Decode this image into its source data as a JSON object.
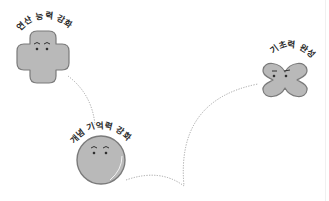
{
  "diagram": {
    "type": "learning-path",
    "colors": {
      "background": "#ffffff",
      "shape_fill": "#b9b9b9",
      "shape_stroke": "#7a7a7a",
      "shape_highlight": "#ffffff",
      "path_stroke": "#9a9a9a",
      "label_text": "#2a2a2a"
    },
    "nodes": [
      {
        "id": "calc",
        "label": "연산 능력 강화",
        "shape": "plus",
        "face": "smiling"
      },
      {
        "id": "concept",
        "label": "개념 기억력 강화",
        "shape": "circle",
        "face": "smiling"
      },
      {
        "id": "basics",
        "label": "기초력 완성",
        "shape": "x-clover",
        "face": "determined"
      }
    ],
    "edges": [
      {
        "from": "calc",
        "to": "concept",
        "style": "dotted"
      },
      {
        "from": "concept",
        "to": "basics",
        "style": "dotted"
      }
    ]
  }
}
